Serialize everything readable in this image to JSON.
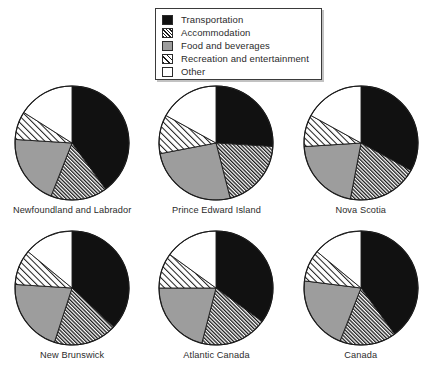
{
  "legend": {
    "items": [
      {
        "label": "Transportation",
        "fill": "black",
        "color": "#111111"
      },
      {
        "label": "Accommodation",
        "fill": "dense",
        "color": "#1a1a1a"
      },
      {
        "label": "Food and beverages",
        "fill": "gray",
        "color": "#9d9d9d"
      },
      {
        "label": "Recreation and entertainment",
        "fill": "sparse",
        "color": "#1a1a1a"
      },
      {
        "label": "Other",
        "fill": "white",
        "color": "#ffffff"
      }
    ]
  },
  "chart_data": {
    "type": "pie",
    "title": "",
    "legend": [
      "Transportation",
      "Accommodation",
      "Food and beverages",
      "Recreation and entertainment",
      "Other"
    ],
    "legend_position": "top-center",
    "categories": [
      "Transportation",
      "Accommodation",
      "Food and beverages",
      "Recreation and entertainment",
      "Other"
    ],
    "units": "percent",
    "start_angle": 0,
    "direction": "clockwise",
    "charts": [
      {
        "label": "Newfoundland and Labrador",
        "values": [
          40,
          16,
          20,
          8,
          16
        ]
      },
      {
        "label": "Prince Edward Island",
        "values": [
          26,
          20,
          26,
          11,
          17
        ]
      },
      {
        "label": "Nova Scotia",
        "values": [
          33,
          20,
          21,
          9,
          17
        ]
      },
      {
        "label": "New Brunswick",
        "values": [
          37,
          18,
          21,
          10,
          14
        ]
      },
      {
        "label": "Atlantic Canada",
        "values": [
          35,
          19,
          21,
          10,
          15
        ]
      },
      {
        "label": "Canada",
        "values": [
          40,
          16,
          21,
          9,
          14
        ]
      }
    ]
  }
}
